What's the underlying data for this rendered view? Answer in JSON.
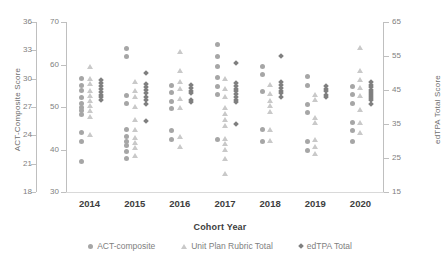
{
  "chart_data": {
    "type": "scatter",
    "title": "",
    "xlabel": "Cohort Year",
    "categories": [
      "2014",
      "2015",
      "2016",
      "2017",
      "2018",
      "2019",
      "2020"
    ],
    "grid": false,
    "legend_position": "bottom",
    "axes": {
      "y_left": {
        "label": "ACT-Composite Score",
        "ticks": [
          "36",
          "33",
          "30",
          "27",
          "24",
          "21",
          "18"
        ],
        "ylim": [
          18,
          36
        ]
      },
      "y_inner": {
        "label": "",
        "ticks": [
          "70",
          "60",
          "50",
          "40",
          "30"
        ],
        "ylim": [
          30,
          70
        ]
      },
      "y_right": {
        "label": "edTPA Total Score",
        "ticks": [
          "65",
          "55",
          "45",
          "35",
          "25",
          "15"
        ],
        "ylim": [
          15,
          65
        ]
      }
    },
    "series": [
      {
        "name": "ACT-composite",
        "marker": "circle",
        "color": "#a6a6a6",
        "axis": "y_left",
        "points": {
          "2014": [
            30.0,
            29.3,
            28.8,
            28.0,
            27.4,
            27.0,
            26.6,
            26.2,
            24.3,
            23.4,
            21.2
          ],
          "2015": [
            33.2,
            32.4,
            28.2,
            27.4,
            24.6,
            23.9,
            23.4,
            22.9,
            22.3,
            21.6
          ],
          "2016": [
            29.3,
            28.5,
            27.6,
            26.8,
            24.5,
            23.6
          ],
          "2017": [
            33.6,
            32.4,
            31.3,
            30.1,
            29.2,
            28.3,
            23.6
          ],
          "2018": [
            31.3,
            30.4,
            28.6,
            24.6,
            23.4
          ],
          "2019": [
            30.2,
            29.3,
            27.3,
            26.4,
            23.3,
            22.4
          ],
          "2020": [
            29.2,
            28.3,
            27.4,
            25.4,
            24.5,
            23.4
          ]
        }
      },
      {
        "name": "Unit Plan Rubric Total",
        "marker": "triangle",
        "color": "#c9c9c9",
        "axis": "y_inner",
        "points": {
          "2014": [
            59.5,
            56.8,
            55.5,
            54.0,
            52.8,
            51.6,
            50.4,
            49.2,
            47.8,
            43.6
          ],
          "2015": [
            56.0,
            54.0,
            52.4,
            50.2,
            47.0,
            44.6,
            42.8,
            41.6,
            40.4,
            38.6
          ],
          "2016": [
            63.0,
            58.6,
            56.0,
            54.4,
            52.0,
            50.0,
            43.0,
            40.8
          ],
          "2017": [
            56.6,
            54.4,
            52.4,
            50.0,
            48.4,
            47.0,
            45.6,
            42.6,
            41.4,
            40.0,
            38.0,
            34.4
          ],
          "2018": [
            55.4,
            53.2,
            51.6,
            50.4,
            49.0,
            44.8,
            42.2
          ],
          "2019": [
            53.0,
            51.8,
            47.6,
            46.4,
            42.4,
            40.6,
            39.0
          ],
          "2020": [
            64.0,
            58.6,
            56.4,
            54.6,
            52.8,
            49.4,
            46.4,
            44.0
          ]
        }
      },
      {
        "name": "edTPA Total",
        "marker": "diamond",
        "color": "#7f7f7f",
        "axis": "y_right",
        "points": {
          "2014": [
            48.0,
            47.0,
            46.2,
            45.2,
            44.4,
            43.6,
            42.8,
            42.0
          ],
          "2015": [
            50.0,
            46.8,
            46.0,
            45.0,
            44.0,
            43.0,
            42.0,
            41.0,
            36.0
          ],
          "2016": [
            46.4,
            45.6,
            44.8,
            44.0,
            42.2,
            41.4
          ],
          "2017": [
            53.0,
            47.0,
            46.2,
            45.4,
            44.6,
            43.8,
            43.0,
            42.2,
            41.4,
            35.0
          ],
          "2018": [
            55.0,
            47.4,
            46.4,
            45.6,
            44.8,
            44.0,
            43.0
          ],
          "2019": [
            46.2,
            45.4,
            44.6,
            43.6,
            42.8
          ],
          "2020": [
            47.4,
            46.6,
            45.8,
            45.0,
            44.4,
            43.8,
            43.2,
            42.6,
            42.0,
            41.0
          ]
        }
      }
    ]
  },
  "legend": {
    "items": [
      {
        "label": "ACT-composite",
        "marker": "circle-marker"
      },
      {
        "label": "Unit Plan Rubric Total",
        "marker": "triangle-marker"
      },
      {
        "label": "edTPA Total",
        "marker": "diamond-marker"
      }
    ]
  }
}
